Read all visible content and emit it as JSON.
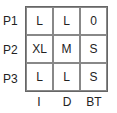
{
  "rows": [
    "P1",
    "P2",
    "P3"
  ],
  "cols": [
    "I",
    "D",
    "BT"
  ],
  "cells": [
    [
      "L",
      "L",
      "0"
    ],
    [
      "XL",
      "M",
      "S"
    ],
    [
      "L",
      "L",
      "S"
    ]
  ]
}
